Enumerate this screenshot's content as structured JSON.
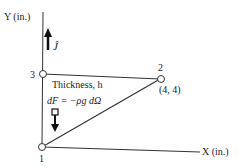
{
  "axes": {
    "y_label": "Y (in.)",
    "x_label": "X (in.)",
    "unit_vector_label": "Ĵ"
  },
  "nodes": [
    {
      "id": "1",
      "label": "1"
    },
    {
      "id": "2",
      "label": "2",
      "coord_label": "(4, 4)"
    },
    {
      "id": "3",
      "label": "3"
    }
  ],
  "annotations": {
    "thickness": "Thickness, h",
    "force": "dF = −ρg dΩ"
  },
  "colors": {
    "line": "#333333",
    "text": "#222222",
    "background": "#ffffff"
  }
}
